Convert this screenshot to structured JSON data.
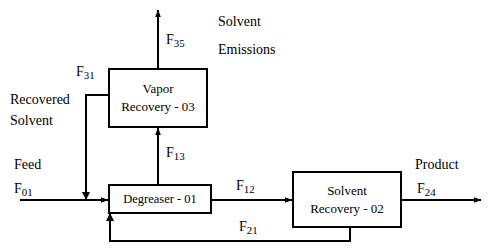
{
  "diagram": {
    "type": "process-flow-diagram",
    "units": [
      {
        "id": "vapor-recovery",
        "line1": "Vapor",
        "line2": "Recovery - 03"
      },
      {
        "id": "degreaser",
        "line1": "Degreaser - 01",
        "line2": ""
      },
      {
        "id": "solvent-recovery",
        "line1": "Solvent",
        "line2": "Recovery - 02"
      }
    ],
    "labels": {
      "solvent_emissions_line1": "Solvent",
      "solvent_emissions_line2": "Emissions",
      "recovered_solvent_line1": "Recovered",
      "recovered_solvent_line2": "Solvent",
      "feed": "Feed",
      "product": "Product"
    },
    "streams": [
      {
        "id": "F35",
        "base": "F",
        "sub": "35"
      },
      {
        "id": "F31",
        "base": "F",
        "sub": "31"
      },
      {
        "id": "F13",
        "base": "F",
        "sub": "13"
      },
      {
        "id": "F01",
        "base": "F",
        "sub": "01"
      },
      {
        "id": "F12",
        "base": "F",
        "sub": "12"
      },
      {
        "id": "F24",
        "base": "F",
        "sub": "24"
      },
      {
        "id": "F21",
        "base": "F",
        "sub": "21"
      }
    ],
    "colors": {
      "line": "#000000",
      "background": "#ffffff",
      "text": "#000000"
    }
  }
}
